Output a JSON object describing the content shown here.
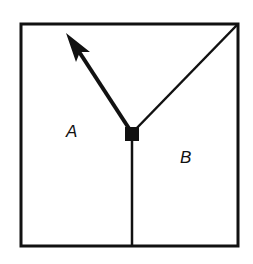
{
  "diagram": {
    "regions": [
      {
        "id": "A",
        "label": "A"
      },
      {
        "id": "B",
        "label": "B"
      }
    ],
    "stroke_color": "#111111",
    "background": "#ffffff"
  }
}
